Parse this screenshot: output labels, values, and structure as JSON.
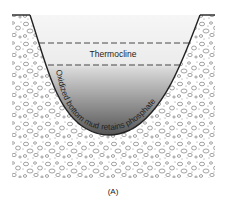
{
  "figure": {
    "caption": "(A)",
    "thermocline_label": "Thermocline",
    "sediment_label": "Oxidized bottom mud retains phosphate",
    "colors": {
      "water_top": "#f4f4f4",
      "water_bottom": "#5a5a5a",
      "ground_bg": "#ffffff",
      "pebble_stroke": "#555555",
      "outline": "#222222"
    }
  }
}
